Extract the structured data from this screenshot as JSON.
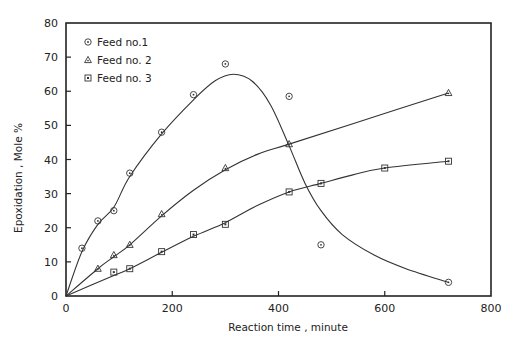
{
  "chart_data": {
    "type": "scatter",
    "title": "",
    "xlabel": "Reaction time , minute",
    "ylabel": "Epoxidation , Mole %",
    "xlim": [
      0,
      800
    ],
    "ylim": [
      0,
      80
    ],
    "xticks": [
      0,
      200,
      400,
      600,
      800
    ],
    "yticks": [
      0,
      10,
      20,
      30,
      40,
      50,
      60,
      70,
      80
    ],
    "grid": false,
    "legend_position": "upper left",
    "series": [
      {
        "name": "Feed no.1",
        "marker": "circle-dot",
        "x": [
          30,
          60,
          90,
          120,
          180,
          240,
          300,
          420,
          480,
          720
        ],
        "y": [
          14,
          22,
          25,
          36,
          48,
          59,
          68,
          58.5,
          15,
          4
        ],
        "fit_curve": [
          [
            0,
            0
          ],
          [
            30,
            13
          ],
          [
            60,
            21
          ],
          [
            90,
            26
          ],
          [
            120,
            35
          ],
          [
            180,
            47.5
          ],
          [
            240,
            57.5
          ],
          [
            280,
            63
          ],
          [
            315,
            65
          ],
          [
            350,
            63
          ],
          [
            385,
            56
          ],
          [
            420,
            44
          ],
          [
            450,
            33
          ],
          [
            480,
            25
          ],
          [
            520,
            18
          ],
          [
            580,
            12
          ],
          [
            640,
            8
          ],
          [
            720,
            4
          ]
        ]
      },
      {
        "name": "Feed no. 2",
        "marker": "triangle",
        "x": [
          60,
          90,
          120,
          180,
          300,
          420,
          720
        ],
        "y": [
          8,
          12,
          15,
          24,
          37.5,
          44.5,
          59.5
        ],
        "fit_curve": [
          [
            0,
            0
          ],
          [
            60,
            8
          ],
          [
            90,
            11.5
          ],
          [
            120,
            15
          ],
          [
            180,
            23.5
          ],
          [
            240,
            31
          ],
          [
            300,
            37
          ],
          [
            360,
            41.5
          ],
          [
            420,
            44.5
          ],
          [
            540,
            50.5
          ],
          [
            720,
            59.5
          ]
        ]
      },
      {
        "name": "Feed no. 3",
        "marker": "square-dot",
        "x": [
          90,
          120,
          180,
          240,
          300,
          420,
          480,
          600,
          720
        ],
        "y": [
          7,
          8,
          13,
          18,
          21,
          30.5,
          33,
          37.5,
          39.5
        ],
        "fit_curve": [
          [
            0,
            0
          ],
          [
            90,
            6
          ],
          [
            120,
            8
          ],
          [
            180,
            12.8
          ],
          [
            240,
            17.5
          ],
          [
            300,
            21.5
          ],
          [
            360,
            26.5
          ],
          [
            420,
            30.5
          ],
          [
            480,
            33
          ],
          [
            540,
            35.5
          ],
          [
            600,
            37.5
          ],
          [
            720,
            39.5
          ]
        ]
      }
    ]
  },
  "plot_area": {
    "left": 66,
    "right": 491,
    "top": 23,
    "bottom": 296
  },
  "colors": {
    "ink": "#222222",
    "line": "#333333",
    "background": "#ffffff"
  }
}
